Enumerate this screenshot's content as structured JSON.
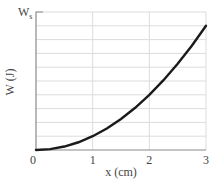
{
  "chart_data": {
    "type": "line",
    "title": "",
    "xlabel": "x (cm)",
    "ylabel": "W (J)",
    "xlim": [
      0,
      3
    ],
    "ylim": [
      0,
      1
    ],
    "y_top_label": "W",
    "y_top_label_sub": "s",
    "x_ticks": [
      0,
      1,
      2,
      3
    ],
    "x_tick_labels": [
      "0",
      "1",
      "2",
      "3"
    ],
    "y_grid_divisions": 10,
    "grid": true,
    "legend": "none",
    "series": [
      {
        "name": "W(x)",
        "color": "#1a1a1a",
        "x": [
          0,
          0.25,
          0.5,
          0.75,
          1,
          1.25,
          1.5,
          1.75,
          2,
          2.25,
          2.5,
          2.75,
          3
        ],
        "y": [
          0,
          0.006,
          0.025,
          0.056,
          0.1,
          0.156,
          0.225,
          0.306,
          0.4,
          0.506,
          0.625,
          0.756,
          0.9
        ]
      }
    ]
  }
}
